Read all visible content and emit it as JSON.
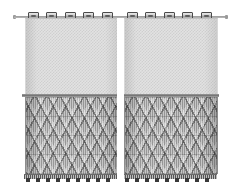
{
  "scene": {
    "title": "Grommet-Top Two-Panel Curtain Set",
    "background_color": "#ffffff",
    "width": 241,
    "height": 189
  },
  "rod": {
    "name": "curtain-rod",
    "color": "#8e8e8e",
    "left_cap_label": "rod end cap left",
    "right_cap_label": "rod end cap right"
  },
  "panels": [
    {
      "id": "left-panel",
      "label": "Left curtain panel",
      "grommet_count": 5,
      "grommet_positions": [
        3,
        21,
        40,
        58,
        77
      ],
      "sheer": {
        "label": "Sheer checkered mesh upper section",
        "base_color": "#e2e2e2",
        "weave_color": "#cfcfcf"
      },
      "seam": {
        "label": "Horizontal seam divider",
        "color": "#6f6f6f"
      },
      "lattice": {
        "label": "Macrame diamond lattice lower section",
        "base_color": "#a8a8a8",
        "thread_light": "#ffffff",
        "thread_dark": "#2d2d2d"
      },
      "hem": {
        "label": "Bottom hem band",
        "color": "#8f8f8f"
      },
      "tassel_count": 9,
      "tassel_positions": [
        2,
        12,
        22,
        32,
        42,
        52,
        62,
        72,
        82
      ],
      "tassel_color": "#3a3a3a"
    },
    {
      "id": "right-panel",
      "label": "Right curtain panel",
      "grommet_count": 5,
      "grommet_positions": [
        3,
        21,
        40,
        58,
        77
      ],
      "sheer": {
        "label": "Sheer checkered mesh upper section",
        "base_color": "#e2e2e2",
        "weave_color": "#cfcfcf"
      },
      "seam": {
        "label": "Horizontal seam divider",
        "color": "#6f6f6f"
      },
      "lattice": {
        "label": "Macrame diamond lattice lower section",
        "base_color": "#a8a8a8",
        "thread_light": "#ffffff",
        "thread_dark": "#2d2d2d"
      },
      "hem": {
        "label": "Bottom hem band",
        "color": "#8f8f8f"
      },
      "tassel_count": 9,
      "tassel_positions": [
        2,
        12,
        22,
        32,
        42,
        52,
        62,
        72,
        82
      ],
      "tassel_color": "#3a3a3a"
    }
  ],
  "center_gap": {
    "label": "Gap between panels"
  }
}
